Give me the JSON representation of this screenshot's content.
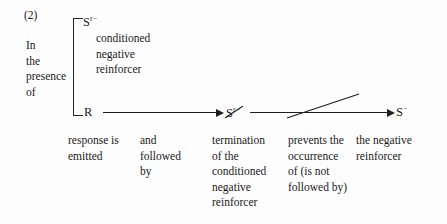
{
  "figure": {
    "item_number": "(2)",
    "presence_phrase": [
      "In",
      "the",
      "presence",
      "of"
    ],
    "bracket_top_symbol": {
      "base": "S",
      "superscript": "r−",
      "struck_through": false
    },
    "bracket_top_descriptor": [
      "conditioned",
      "negative",
      "reinforcer"
    ],
    "bracket_bottom_symbol": {
      "base": "R",
      "superscript": "",
      "struck_through": false
    },
    "middle_symbol": {
      "base": "S",
      "superscript": "r−",
      "struck_through": true
    },
    "right_symbol": {
      "base": "S",
      "superscript": "−",
      "struck_through": false
    },
    "arrows": [
      {
        "name": "response-to-termination",
        "crossed_out": false
      },
      {
        "name": "termination-prevents-negative-reinforcer",
        "crossed_out": true
      }
    ],
    "captions": [
      {
        "lines": [
          "response is",
          "emitted"
        ]
      },
      {
        "lines": [
          "and",
          "followed",
          "by"
        ]
      },
      {
        "lines": [
          "termination",
          "of the",
          "conditioned",
          "negative",
          "reinforcer"
        ]
      },
      {
        "lines": [
          "prevents the",
          "occurrence",
          "of (is not",
          "followed by)"
        ]
      },
      {
        "lines": [
          "the negative",
          "reinforcer"
        ]
      }
    ],
    "colors": {
      "ink": "#1a1a1a",
      "line": "#1f1f1f",
      "paper": "#fdfdfd"
    }
  }
}
